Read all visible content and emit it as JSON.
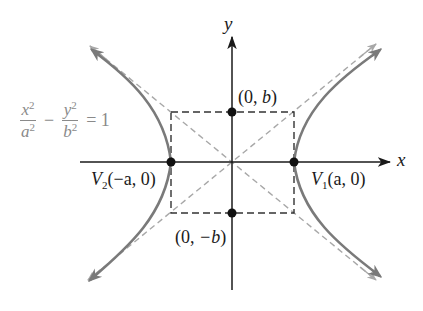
{
  "figure": {
    "equation": {
      "term1_num": "x",
      "term1_den": "a",
      "term2_num": "y",
      "term2_den": "b",
      "exponent": "2",
      "minus": "−",
      "equals": "= 1"
    },
    "axes": {
      "x_label": "x",
      "y_label": "y"
    },
    "points": {
      "v1": {
        "name": "V",
        "sub": "1",
        "coords": "(a, 0)"
      },
      "v2": {
        "name": "V",
        "sub": "2",
        "coords": "(−a, 0)"
      },
      "top": {
        "open": "(0, ",
        "var": "b",
        "close": ")"
      },
      "bottom": {
        "open": "(0, ",
        "var": "−b",
        "close": ")"
      }
    },
    "colors": {
      "axis": "#1a1a1a",
      "curve": "#7a7a7a",
      "asymptote": "#a8a8a8",
      "box": "#333333",
      "equation": "#8a8a8a"
    }
  }
}
